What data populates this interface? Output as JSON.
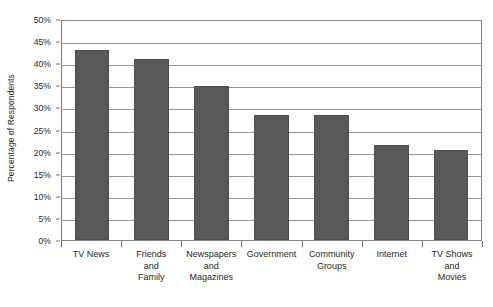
{
  "chart_data": {
    "type": "bar",
    "title": "",
    "xlabel": "",
    "ylabel": "Percentage of Respondents",
    "ylim": [
      0,
      50
    ],
    "ytick_labels": [
      "50%",
      "45%",
      "40%",
      "35%",
      "30%",
      "25%",
      "20%",
      "15%",
      "10%",
      "5%",
      "0%"
    ],
    "ytick_values": [
      50,
      45,
      40,
      35,
      30,
      25,
      20,
      15,
      10,
      5,
      0
    ],
    "grid": true,
    "legend": "none",
    "orientation": "vertical",
    "bar_color": "#595959",
    "categories": [
      "TV News",
      "Friends and Family",
      "Newspapers and Magazines",
      "Government",
      "Community Groups",
      "Internet",
      "TV Shows and Movies"
    ],
    "category_label_lines": [
      [
        "TV News"
      ],
      [
        "Friends",
        "and",
        "Family"
      ],
      [
        "Newspapers",
        "and",
        "Magazines"
      ],
      [
        "Government"
      ],
      [
        "Community",
        "Groups"
      ],
      [
        "Internet"
      ],
      [
        "TV Shows",
        "and",
        "Movies"
      ]
    ],
    "values": [
      43.0,
      41.0,
      34.8,
      28.3,
      28.3,
      21.5,
      20.3
    ]
  },
  "colors": {
    "bar": "#595959",
    "bar_edge": "#4d4d4d",
    "gridline": "#939598",
    "axis": "#808285",
    "text": "#231f20",
    "background": "#ffffff"
  }
}
